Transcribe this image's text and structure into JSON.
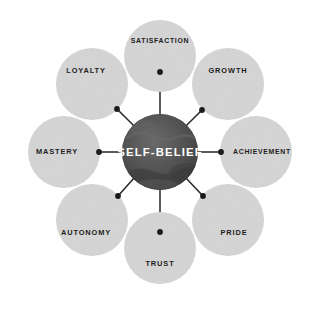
{
  "diagram": {
    "type": "hub-and-spoke",
    "title": "SELF-BELIEF",
    "core": {
      "label": "SELF-BELIEF",
      "text_color": "#ffffff",
      "fill_color": "#4e4e4e",
      "texture": "grayscale-globe",
      "center_x": 160,
      "center_y": 152,
      "radius": 38
    },
    "background_color": "#ffffff",
    "satellite_fill_color": "#d6d6d6",
    "satellite_text_color": "#1d1d1d",
    "connector_color": "#262626",
    "satellite_radius": 36,
    "orbit_radius": 96,
    "nodes": [
      {
        "label": "SATISFACTION",
        "position": "top",
        "angle_deg": 270,
        "cx": 160,
        "cy": 56,
        "label_x": 160,
        "label_y": 41,
        "dot_x": 160,
        "dot_y": 72,
        "small": true
      },
      {
        "label": "GROWTH",
        "position": "top-right",
        "angle_deg": 315,
        "cx": 228,
        "cy": 84,
        "label_x": 228,
        "label_y": 71,
        "dot_x": 202,
        "dot_y": 110,
        "small": false
      },
      {
        "label": "ACHIEVEMENT",
        "position": "right",
        "angle_deg": 0,
        "cx": 256,
        "cy": 152,
        "label_x": 262,
        "label_y": 152,
        "dot_x": 221,
        "dot_y": 152,
        "small": true
      },
      {
        "label": "PRIDE",
        "position": "bottom-right",
        "angle_deg": 45,
        "cx": 228,
        "cy": 220,
        "label_x": 234,
        "label_y": 233,
        "dot_x": 203,
        "dot_y": 196,
        "small": false
      },
      {
        "label": "TRUST",
        "position": "bottom",
        "angle_deg": 90,
        "cx": 160,
        "cy": 248,
        "label_x": 160,
        "label_y": 264,
        "dot_x": 160,
        "dot_y": 232,
        "small": false
      },
      {
        "label": "AUTONOMY",
        "position": "bottom-left",
        "angle_deg": 135,
        "cx": 92,
        "cy": 220,
        "label_x": 86,
        "label_y": 233,
        "dot_x": 118,
        "dot_y": 196,
        "small": false
      },
      {
        "label": "MASTERY",
        "position": "left",
        "angle_deg": 180,
        "cx": 64,
        "cy": 152,
        "label_x": 57,
        "label_y": 152,
        "dot_x": 99,
        "dot_y": 152,
        "small": false
      },
      {
        "label": "LOYALTY",
        "position": "top-left",
        "angle_deg": 225,
        "cx": 92,
        "cy": 84,
        "label_x": 86,
        "label_y": 71,
        "dot_x": 117,
        "dot_y": 109,
        "small": false
      }
    ]
  }
}
